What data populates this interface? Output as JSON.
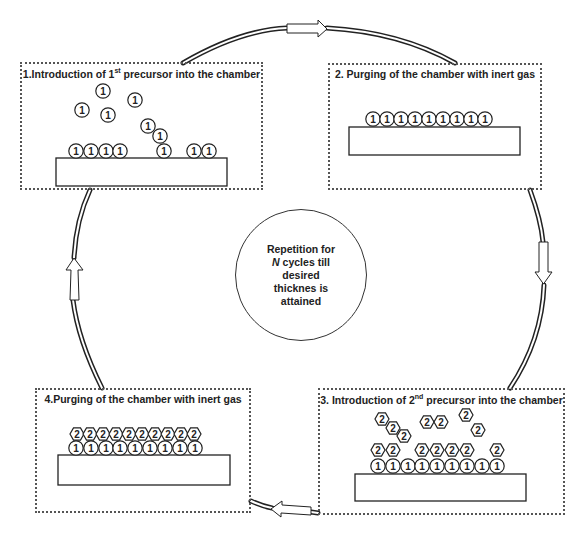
{
  "diagram": {
    "type": "cycle",
    "steps": [
      {
        "id": 1,
        "label_prefix": "1.Introduction of 1",
        "label_sup": "st",
        "label_suffix": " precursor into the chamber",
        "box": {
          "x": 20,
          "y": 62,
          "w": 243,
          "h": 128
        },
        "substrate": {
          "x": 56,
          "y": 158,
          "w": 171,
          "h": 28
        },
        "precursor1_molecules": [
          {
            "x": 76,
            "y": 151
          },
          {
            "x": 91,
            "y": 151
          },
          {
            "x": 106,
            "y": 151
          },
          {
            "x": 120,
            "y": 151
          },
          {
            "x": 164,
            "y": 151
          },
          {
            "x": 194,
            "y": 151
          },
          {
            "x": 209,
            "y": 151
          },
          {
            "x": 103,
            "y": 91
          },
          {
            "x": 135,
            "y": 100
          },
          {
            "x": 82,
            "y": 110
          },
          {
            "x": 108,
            "y": 115
          },
          {
            "x": 148,
            "y": 126
          },
          {
            "x": 160,
            "y": 136
          }
        ],
        "precursor2_molecules": []
      },
      {
        "id": 2,
        "label_prefix": "2. Purging of the chamber with inert gas",
        "label_sup": "",
        "label_suffix": "",
        "box": {
          "x": 328,
          "y": 63,
          "w": 214,
          "h": 127
        },
        "substrate": {
          "x": 349,
          "y": 127,
          "w": 171,
          "h": 28
        },
        "precursor1_molecules": [
          {
            "x": 373,
            "y": 119
          },
          {
            "x": 387,
            "y": 119
          },
          {
            "x": 401,
            "y": 119
          },
          {
            "x": 415,
            "y": 119
          },
          {
            "x": 429,
            "y": 119
          },
          {
            "x": 443,
            "y": 119
          },
          {
            "x": 457,
            "y": 119
          },
          {
            "x": 471,
            "y": 119
          },
          {
            "x": 485,
            "y": 119
          }
        ],
        "precursor2_molecules": []
      },
      {
        "id": 3,
        "label_prefix": "3. Introduction of 2",
        "label_sup": "nd",
        "label_suffix": " precursor into the chamber",
        "box": {
          "x": 318,
          "y": 388,
          "w": 247,
          "h": 127
        },
        "substrate": {
          "x": 355,
          "y": 474,
          "w": 171,
          "h": 27
        },
        "precursor1_molecules": [
          {
            "x": 378,
            "y": 466
          },
          {
            "x": 393,
            "y": 466
          },
          {
            "x": 408,
            "y": 466
          },
          {
            "x": 422,
            "y": 466
          },
          {
            "x": 437,
            "y": 466
          },
          {
            "x": 452,
            "y": 466
          },
          {
            "x": 467,
            "y": 466
          },
          {
            "x": 482,
            "y": 466
          },
          {
            "x": 497,
            "y": 466
          }
        ],
        "precursor2_molecules": [
          {
            "x": 378,
            "y": 450
          },
          {
            "x": 393,
            "y": 450
          },
          {
            "x": 422,
            "y": 450
          },
          {
            "x": 437,
            "y": 450
          },
          {
            "x": 452,
            "y": 450
          },
          {
            "x": 467,
            "y": 450
          },
          {
            "x": 497,
            "y": 450
          },
          {
            "x": 382,
            "y": 419
          },
          {
            "x": 393,
            "y": 428
          },
          {
            "x": 404,
            "y": 436
          },
          {
            "x": 427,
            "y": 422
          },
          {
            "x": 441,
            "y": 422
          },
          {
            "x": 466,
            "y": 415
          },
          {
            "x": 478,
            "y": 430
          }
        ]
      },
      {
        "id": 4,
        "label_prefix": "4.Purging of the chamber with inert gas",
        "label_sup": "",
        "label_suffix": "",
        "box": {
          "x": 35,
          "y": 388,
          "w": 216,
          "h": 125
        },
        "substrate": {
          "x": 58,
          "y": 455,
          "w": 172,
          "h": 30
        },
        "precursor1_molecules": [
          {
            "x": 76,
            "y": 448
          },
          {
            "x": 91,
            "y": 448
          },
          {
            "x": 106,
            "y": 448
          },
          {
            "x": 120,
            "y": 448
          },
          {
            "x": 135,
            "y": 448
          },
          {
            "x": 150,
            "y": 448
          },
          {
            "x": 165,
            "y": 448
          },
          {
            "x": 180,
            "y": 448
          },
          {
            "x": 195,
            "y": 448
          }
        ],
        "precursor2_molecules": [
          {
            "x": 77,
            "y": 434
          },
          {
            "x": 90,
            "y": 434
          },
          {
            "x": 103,
            "y": 434
          },
          {
            "x": 116,
            "y": 434
          },
          {
            "x": 129,
            "y": 434
          },
          {
            "x": 142,
            "y": 434
          },
          {
            "x": 155,
            "y": 434
          },
          {
            "x": 168,
            "y": 434
          },
          {
            "x": 181,
            "y": 434
          },
          {
            "x": 194,
            "y": 434
          }
        ]
      }
    ],
    "molecule_labels": {
      "precursor1": "1",
      "precursor2": "2"
    },
    "center": {
      "line1": "Repetition for",
      "line2_italic": "N",
      "line2_rest": " cycles till",
      "line3": "desired",
      "line4": "thicknes is",
      "line5": "attained"
    },
    "cycle_arrows": [
      {
        "name": "arrow-1-to-2",
        "direction": "right",
        "x": 287,
        "y": 28
      },
      {
        "name": "arrow-2-to-3",
        "direction": "down",
        "x": 543,
        "y": 260
      },
      {
        "name": "arrow-3-to-4",
        "direction": "left",
        "x": 282,
        "y": 511
      },
      {
        "name": "arrow-4-to-1",
        "direction": "up",
        "x": 71,
        "y": 262
      }
    ],
    "colors": {
      "line": "#222222",
      "box_border": "#555555",
      "background": "#ffffff"
    }
  }
}
